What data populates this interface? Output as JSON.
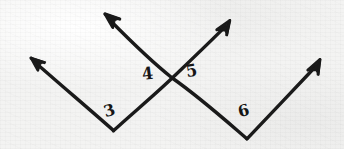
{
  "figure": {
    "kind": "hand-drawn-geometry-diagram",
    "width": 344,
    "height": 149,
    "ink_color": "#1a1a1a",
    "paper_color": "#f3f3f2"
  },
  "labels": [
    {
      "id": "label-3",
      "text": "3",
      "x": 104,
      "y": 103
    },
    {
      "id": "label-4",
      "text": "4",
      "x": 142,
      "y": 66
    },
    {
      "id": "label-5",
      "text": "5",
      "x": 186,
      "y": 63
    },
    {
      "id": "label-6",
      "text": "6",
      "x": 238,
      "y": 103
    }
  ],
  "vertices": [
    {
      "id": "left-vertex",
      "x": 113,
      "y": 131
    },
    {
      "id": "right-vertex",
      "x": 247,
      "y": 139
    },
    {
      "id": "crossing-point",
      "x": 172,
      "y": 78
    }
  ],
  "rays": [
    {
      "id": "ray-upper-left",
      "from": "left-vertex",
      "tip_x": 30,
      "tip_y": 57
    },
    {
      "id": "ray-upper-left-inner",
      "from": "right-vertex",
      "tip_x": 104,
      "tip_y": 13
    },
    {
      "id": "ray-upper-right-inner",
      "from": "left-vertex",
      "tip_x": 230,
      "tip_y": 19
    },
    {
      "id": "ray-upper-right",
      "from": "right-vertex",
      "tip_x": 320,
      "tip_y": 58
    }
  ]
}
